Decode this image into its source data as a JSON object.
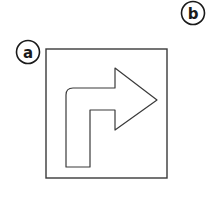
{
  "figure": {
    "background_color": "#ffffff",
    "stroke_color": "#3a3a3a",
    "label_color": "#1a1a1a",
    "panels": [
      {
        "id": "a",
        "label": "a",
        "circle_cx": 28,
        "circle_cy": 52,
        "circle_r": 11.5,
        "clipped": false
      },
      {
        "id": "b",
        "label": "b",
        "circle_cx": 193,
        "circle_cy": 13,
        "circle_r": 11.5,
        "clipped": true
      }
    ],
    "frame": {
      "name": "square-outline",
      "x": 46,
      "y": 49,
      "width": 121,
      "height": 129
    },
    "arrow": {
      "name": "turn-right-arrow",
      "description": "rounded right-turn arrow",
      "corner_radius": 7,
      "outline_points": "66,167 66,95 73,88 115,88 115,68 157,100 115,130 115,110 90,110 90,167"
    }
  }
}
